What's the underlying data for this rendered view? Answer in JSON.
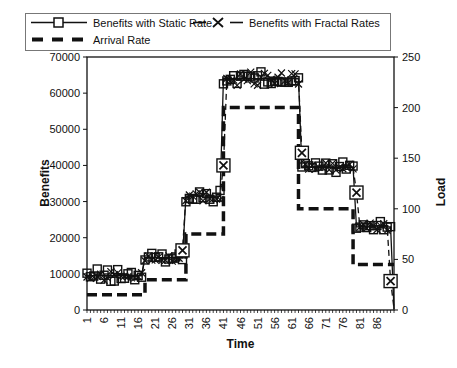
{
  "chart_data": {
    "type": "line",
    "title": "",
    "xlabel": "Time",
    "ylabel_left": "Benefits",
    "ylabel_right": "Load",
    "background": "#ffffff",
    "stroke_color": "#111111",
    "legend_position": "top-left",
    "grid": false,
    "x_axis": {
      "min": 1,
      "max": 90,
      "axis_max": 91,
      "tick_interval": 1,
      "labels": [
        1,
        6,
        11,
        16,
        21,
        26,
        31,
        36,
        41,
        46,
        51,
        56,
        61,
        66,
        71,
        76,
        81,
        86
      ]
    },
    "y_left": {
      "min": 0,
      "max": 70000,
      "step": 10000,
      "ticks": [
        0,
        10000,
        20000,
        30000,
        40000,
        50000,
        60000,
        70000
      ]
    },
    "y_right": {
      "min": 0,
      "max": 250,
      "step": 50,
      "ticks": [
        0,
        50,
        100,
        150,
        200,
        250
      ]
    },
    "series": [
      {
        "name": "Benefits with Static Rate",
        "axis": "left",
        "marker": "square",
        "line": "solid",
        "plateaus": [
          {
            "t_start": 1,
            "t_end": 17,
            "value": 9500,
            "spread": 1900
          },
          {
            "t_start": 18,
            "t_end": 29,
            "value": 14500,
            "spread": 1300
          },
          {
            "t_start": 30,
            "t_end": 40,
            "value": 31500,
            "spread": 1600
          },
          {
            "t_start": 41,
            "t_end": 63,
            "value": 64000,
            "spread": 2200
          },
          {
            "t_start": 64,
            "t_end": 79,
            "value": 39500,
            "spread": 1500
          },
          {
            "t_start": 80,
            "t_end": 90,
            "value": 23000,
            "spread": 1500
          }
        ],
        "line_points": [
          [
            1,
            9500
          ],
          [
            17,
            9500
          ],
          [
            18,
            14500
          ],
          [
            29,
            14500
          ],
          [
            30,
            31500
          ],
          [
            40,
            31500
          ],
          [
            41,
            64000
          ],
          [
            63,
            64000
          ],
          [
            64,
            39500
          ],
          [
            79,
            39500
          ],
          [
            80,
            23000
          ],
          [
            90,
            23000
          ],
          [
            91,
            300
          ]
        ]
      },
      {
        "name": "Benefits with Fractal Rates",
        "axis": "left",
        "marker": "x",
        "line": "dashed",
        "plateaus": [
          {
            "t_start": 1,
            "t_end": 17,
            "value": 9500,
            "spread": 1700
          },
          {
            "t_start": 18,
            "t_end": 28,
            "value": 14500,
            "spread": 1200
          },
          {
            "t_start": 30,
            "t_end": 40,
            "value": 31500,
            "spread": 1400
          },
          {
            "t_start": 42,
            "t_end": 63,
            "value": 64000,
            "spread": 2000
          },
          {
            "t_start": 65,
            "t_end": 79,
            "value": 39500,
            "spread": 1300
          },
          {
            "t_start": 81,
            "t_end": 89,
            "value": 23000,
            "spread": 1300
          }
        ],
        "transition_markers": [
          [
            29,
            16500
          ],
          [
            41,
            40000
          ],
          [
            64,
            43500
          ],
          [
            80,
            32500
          ],
          [
            90,
            8000
          ]
        ],
        "line_points": [
          [
            1,
            9500
          ],
          [
            17,
            9500
          ],
          [
            18,
            14500
          ],
          [
            28,
            14500
          ],
          [
            29,
            16500
          ],
          [
            30,
            31500
          ],
          [
            40,
            31500
          ],
          [
            41,
            40000
          ],
          [
            42,
            64000
          ],
          [
            63,
            64000
          ],
          [
            64,
            43500
          ],
          [
            65,
            39500
          ],
          [
            79,
            39500
          ],
          [
            80,
            32500
          ],
          [
            81,
            23000
          ],
          [
            89,
            23000
          ],
          [
            90,
            8000
          ],
          [
            91,
            400
          ]
        ]
      },
      {
        "name": "Arrival Rate",
        "axis": "right",
        "marker": "none",
        "line": "thick-dashed",
        "line_points": [
          [
            1,
            15
          ],
          [
            18,
            15
          ],
          [
            18,
            30
          ],
          [
            30,
            30
          ],
          [
            30,
            75
          ],
          [
            41,
            75
          ],
          [
            41,
            200
          ],
          [
            63,
            200
          ],
          [
            63,
            100
          ],
          [
            79,
            100
          ],
          [
            79,
            45
          ],
          [
            91,
            45
          ]
        ]
      }
    ]
  }
}
